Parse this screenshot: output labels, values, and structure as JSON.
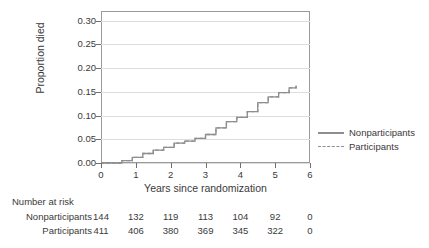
{
  "chart_data": {
    "type": "line",
    "title": "",
    "xlabel": "Years since randomization",
    "ylabel": "Proportion died",
    "xlim": [
      0,
      6
    ],
    "ylim": [
      0,
      0.32
    ],
    "xticks": [
      "0",
      "1",
      "2",
      "3",
      "4",
      "5",
      "6"
    ],
    "xtick_values": [
      0,
      1,
      2,
      3,
      4,
      5,
      6
    ],
    "yticks": [
      "0.00",
      "0.05",
      "0.10",
      "0.15",
      "0.20",
      "0.25",
      "0.30"
    ],
    "ytick_values": [
      0.0,
      0.05,
      0.1,
      0.15,
      0.2,
      0.25,
      0.3
    ],
    "grid": "horizontal",
    "legend_position": "right",
    "series": [
      {
        "name": "Nonparticipants",
        "style": "solid",
        "color": "#8e8e8e",
        "x": [
          0.0,
          0.3,
          0.6,
          0.9,
          1.2,
          1.5,
          1.8,
          2.1,
          2.4,
          2.7,
          3.0,
          3.3,
          3.6,
          3.9,
          4.2,
          4.5,
          4.8,
          5.1,
          5.4,
          5.6
        ],
        "y": [
          0.0,
          0.0,
          0.005,
          0.012,
          0.02,
          0.027,
          0.033,
          0.042,
          0.046,
          0.052,
          0.06,
          0.074,
          0.087,
          0.096,
          0.108,
          0.127,
          0.139,
          0.148,
          0.158,
          0.163
        ]
      },
      {
        "name": "Participants",
        "style": "dashed",
        "color": "#8e8e8e",
        "x": [
          0.0,
          0.3,
          0.6,
          0.9,
          1.2,
          1.5,
          1.8,
          2.1,
          2.4,
          2.7,
          3.0,
          3.3,
          3.6,
          3.9,
          4.2,
          4.5,
          4.8,
          5.1,
          5.4,
          5.6
        ],
        "y": [
          0.0,
          0.0,
          0.005,
          0.012,
          0.02,
          0.027,
          0.033,
          0.042,
          0.046,
          0.052,
          0.06,
          0.074,
          0.087,
          0.096,
          0.108,
          0.127,
          0.139,
          0.148,
          0.158,
          0.163
        ]
      }
    ]
  },
  "legend": {
    "items": [
      {
        "label": "Nonparticipants",
        "style": "solid"
      },
      {
        "label": "Participants",
        "style": "dashed"
      }
    ]
  },
  "risk_table": {
    "title": "Number at risk",
    "time_points": [
      0,
      1,
      2,
      3,
      4,
      5,
      6
    ],
    "rows": [
      {
        "label": "Nonparticipants",
        "values": [
          "144",
          "132",
          "119",
          "113",
          "104",
          "92",
          "0"
        ]
      },
      {
        "label": "Participants",
        "values": [
          "411",
          "406",
          "380",
          "369",
          "345",
          "322",
          "0"
        ]
      }
    ]
  },
  "colors": {
    "line": "#8e8e8e",
    "frame": "#9a9a9a",
    "grid": "#dddddd",
    "text": "#3a3a3a",
    "background": "#ffffff"
  }
}
